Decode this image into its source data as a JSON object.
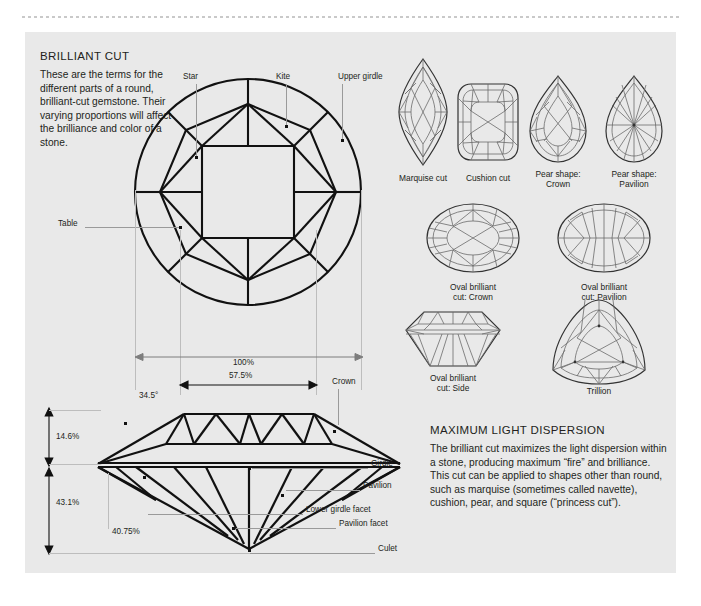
{
  "page": {
    "panel_bg": "#e9e9e9",
    "ink": "#231f20",
    "leader_color": "#9a9a9a"
  },
  "sections": {
    "brilliant_cut": {
      "title": "BRILLIANT CUT",
      "body": "These are the terms for the different parts of a round, brilliant-cut gemstone. Their varying proportions will affect the brilliance and color of a stone."
    },
    "dispersion": {
      "title": "MAXIMUM LIGHT DISPERSION",
      "body": "The brilliant cut maximizes the light dispersion within a stone, producing maximum “fire” and brilliance. This cut can be applied to shapes other than round, such as marquise (sometimes called navette), cushion, pear, and square (“princess cut”)."
    }
  },
  "top_view_labels": {
    "star": "Star",
    "kite": "Kite",
    "upper_girdle": "Upper girdle",
    "table": "Table"
  },
  "side_view_labels": {
    "crown": "Crown",
    "girdle": "Girdle",
    "pavilion": "Pavilion",
    "lower_girdle_facet": "Lower girdle facet",
    "pavilion_facet": "Pavilion facet",
    "culet": "Culet"
  },
  "dimensions": {
    "diameter": "100%",
    "table_width": "57.5%",
    "crown_angle": "34.5°",
    "crown_height": "14.6%",
    "pavilion_depth": "43.1%",
    "pavilion_angle": "40.75%"
  },
  "gem_shapes": [
    {
      "caption": "Marquise cut"
    },
    {
      "caption": "Cushion cut"
    },
    {
      "caption": "Pear shape:\nCrown"
    },
    {
      "caption": "Pear shape:\nPavilion"
    },
    {
      "caption": "Oval brilliant\ncut: Crown"
    },
    {
      "caption": "Oval brilliant\ncut: Pavilion"
    },
    {
      "caption": "Oval brilliant\ncut: Side"
    },
    {
      "caption": "Trillion"
    }
  ],
  "gem_captions": {
    "marquise": "Marquise cut",
    "cushion": "Cushion cut",
    "pear_crown_l1": "Pear shape:",
    "pear_crown_l2": "Crown",
    "pear_pavilion_l1": "Pear shape:",
    "pear_pavilion_l2": "Pavilion",
    "oval_crown_l1": "Oval brilliant",
    "oval_crown_l2": "cut: Crown",
    "oval_pavilion_l1": "Oval brilliant",
    "oval_pavilion_l2": "cut: Pavilion",
    "oval_side_l1": "Oval brilliant",
    "oval_side_l2": "cut: Side",
    "trillion": "Trillion"
  }
}
